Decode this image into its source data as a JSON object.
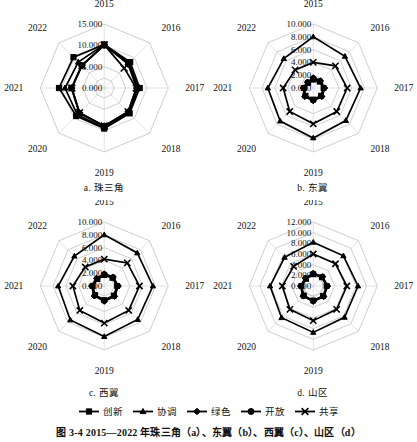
{
  "figure": {
    "caption": "图 3-4  2015—2022 年珠三角（a）、东翼（b）、西翼（c）、山区（d）"
  },
  "legend": {
    "position": "bottom-center",
    "items": [
      {
        "label": "创新",
        "marker": "square-marker"
      },
      {
        "label": "协调",
        "marker": "triangle-marker"
      },
      {
        "label": "绿色",
        "marker": "diamond-marker"
      },
      {
        "label": "开放",
        "marker": "circle-marker"
      },
      {
        "label": "共享",
        "marker": "x-marker"
      }
    ]
  },
  "panels": [
    {
      "key": "a",
      "subcaption": "a. 珠三角"
    },
    {
      "key": "b",
      "subcaption": "b. 东翼"
    },
    {
      "key": "c",
      "subcaption": "c. 西翼"
    },
    {
      "key": "d",
      "subcaption": "d. 山区"
    }
  ],
  "chart_data": [
    {
      "type": "radar",
      "title": "a. 珠三角",
      "categories": [
        "2015",
        "2016",
        "2017",
        "2018",
        "2019",
        "2020",
        "2021",
        "2022"
      ],
      "tick_labels": [
        "0.000",
        "5.000",
        "10.000",
        "15.000"
      ],
      "ticks": [
        0,
        5,
        10,
        15
      ],
      "rlim": [
        0,
        15
      ],
      "grid": true,
      "legend": [
        "创新",
        "协调",
        "绿色",
        "开放",
        "共享"
      ],
      "series": [
        {
          "name": "创新",
          "marker": "square",
          "values": [
            10.2,
            8.6,
            8.3,
            8.4,
            9.5,
            9.3,
            10.6,
            10.2
          ]
        },
        {
          "name": "协调",
          "marker": "triangle",
          "values": [
            10.2,
            8.0,
            8.1,
            8.2,
            9.3,
            8.9,
            9.2,
            8.6
          ]
        },
        {
          "name": "绿色",
          "marker": "diamond",
          "values": [
            10.1,
            7.9,
            7.6,
            7.9,
            8.9,
            8.2,
            7.6,
            7.4
          ]
        },
        {
          "name": "开放",
          "marker": "circle",
          "values": [
            10.0,
            8.3,
            7.8,
            8.1,
            9.0,
            8.3,
            7.7,
            7.5
          ]
        },
        {
          "name": "共享",
          "marker": "x",
          "values": [
            10.1,
            6.6,
            7.5,
            7.9,
            8.9,
            8.2,
            7.6,
            7.4
          ]
        }
      ]
    },
    {
      "type": "radar",
      "title": "b. 东翼",
      "categories": [
        "2015",
        "2016",
        "2017",
        "2018",
        "2019",
        "2020",
        "2021",
        "2022"
      ],
      "tick_labels": [
        "0.000",
        "2.000",
        "4.000",
        "6.000",
        "8.000",
        "10.000"
      ],
      "ticks": [
        0,
        2,
        4,
        6,
        8,
        10
      ],
      "rlim": [
        0,
        10
      ],
      "grid": true,
      "legend": [
        "创新",
        "协调",
        "绿色",
        "开放",
        "共享"
      ],
      "series": [
        {
          "name": "创新",
          "marker": "square",
          "values": [
            1.3,
            1.4,
            1.6,
            1.7,
            1.8,
            1.7,
            1.4,
            1.1
          ]
        },
        {
          "name": "协调",
          "marker": "triangle",
          "values": [
            8.0,
            7.0,
            7.4,
            7.2,
            7.8,
            7.3,
            7.1,
            6.5
          ]
        },
        {
          "name": "绿色",
          "marker": "diamond",
          "values": [
            1.6,
            1.6,
            1.8,
            1.9,
            2.0,
            1.9,
            1.6,
            1.3
          ]
        },
        {
          "name": "开放",
          "marker": "circle",
          "values": [
            1.5,
            1.5,
            1.7,
            1.8,
            1.9,
            1.8,
            1.5,
            1.2
          ]
        },
        {
          "name": "共享",
          "marker": "x",
          "values": [
            4.0,
            4.9,
            5.3,
            5.2,
            5.6,
            5.2,
            4.7,
            4.0
          ]
        }
      ]
    },
    {
      "type": "radar",
      "title": "c. 西翼",
      "categories": [
        "2015",
        "2016",
        "2017",
        "2018",
        "2019",
        "2020",
        "2021",
        "2022"
      ],
      "tick_labels": [
        "0.000",
        "2.000",
        "4.000",
        "6.000",
        "8.000",
        "10.000"
      ],
      "ticks": [
        0,
        2,
        4,
        6,
        8,
        10
      ],
      "rlim": [
        0,
        10
      ],
      "grid": true,
      "legend": [
        "创新",
        "协调",
        "绿色",
        "开放",
        "共享"
      ],
      "series": [
        {
          "name": "创新",
          "marker": "square",
          "values": [
            1.7,
            1.8,
            2.0,
            2.1,
            2.2,
            2.0,
            1.8,
            1.5
          ]
        },
        {
          "name": "协调",
          "marker": "triangle",
          "values": [
            8.0,
            7.3,
            7.6,
            7.4,
            7.9,
            7.5,
            7.2,
            6.6
          ]
        },
        {
          "name": "绿色",
          "marker": "diamond",
          "values": [
            1.9,
            2.0,
            2.2,
            2.3,
            2.4,
            2.2,
            2.0,
            1.7
          ]
        },
        {
          "name": "开放",
          "marker": "circle",
          "values": [
            1.8,
            1.9,
            2.1,
            2.2,
            2.3,
            2.1,
            1.9,
            1.6
          ]
        },
        {
          "name": "共享",
          "marker": "x",
          "values": [
            4.2,
            5.1,
            5.5,
            5.4,
            5.8,
            5.4,
            4.9,
            4.2
          ]
        }
      ]
    },
    {
      "type": "radar",
      "title": "d. 山区",
      "categories": [
        "2015",
        "2016",
        "2017",
        "2018",
        "2019",
        "2020",
        "2021",
        "2022"
      ],
      "tick_labels": [
        "0.000",
        "2.000",
        "4.000",
        "6.000",
        "8.000",
        "10.000",
        "12.000"
      ],
      "ticks": [
        0,
        2,
        4,
        6,
        8,
        10,
        12
      ],
      "rlim": [
        0,
        12
      ],
      "grid": true,
      "legend": [
        "创新",
        "协调",
        "绿色",
        "开放",
        "共享"
      ],
      "series": [
        {
          "name": "创新",
          "marker": "square",
          "values": [
            2.2,
            2.3,
            2.5,
            2.6,
            2.7,
            2.5,
            2.2,
            1.9
          ]
        },
        {
          "name": "协调",
          "marker": "triangle",
          "values": [
            8.2,
            8.0,
            8.4,
            8.3,
            8.7,
            8.4,
            8.1,
            7.6
          ]
        },
        {
          "name": "绿色",
          "marker": "diamond",
          "values": [
            2.4,
            2.5,
            2.7,
            2.8,
            2.9,
            2.7,
            2.4,
            2.1
          ]
        },
        {
          "name": "开放",
          "marker": "circle",
          "values": [
            2.3,
            2.4,
            2.6,
            2.7,
            2.8,
            2.6,
            2.3,
            2.0
          ]
        },
        {
          "name": "共享",
          "marker": "x",
          "values": [
            6.0,
            5.9,
            6.3,
            6.2,
            6.5,
            6.2,
            5.8,
            5.2
          ]
        }
      ]
    }
  ]
}
